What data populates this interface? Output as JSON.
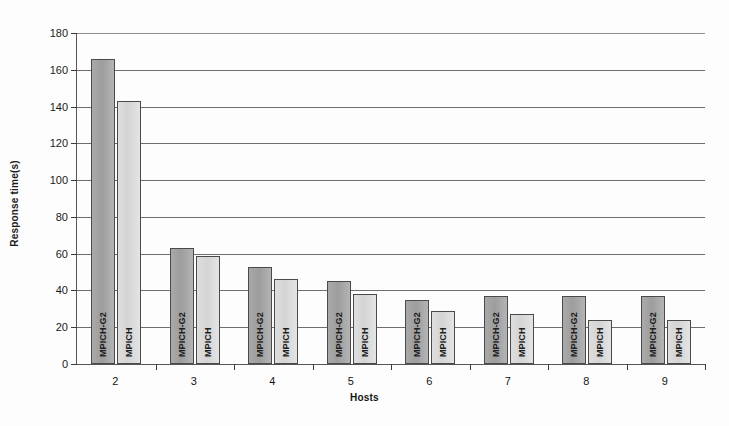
{
  "chart_data": {
    "type": "bar",
    "title": "",
    "xlabel": "Hosts",
    "ylabel": "Response time(s)",
    "categories": [
      "2",
      "3",
      "4",
      "5",
      "6",
      "7",
      "8",
      "9"
    ],
    "ylim": [
      0,
      180
    ],
    "yticks": [
      0,
      20,
      40,
      60,
      80,
      100,
      120,
      140,
      160,
      180
    ],
    "ytick_labels": [
      "0",
      "20",
      "40",
      "60",
      "80",
      "100",
      "120",
      "140",
      "160",
      "180"
    ],
    "grid": true,
    "legend": "none (bars labelled in-place)",
    "series": [
      {
        "name": "MPICH-G2",
        "color": "#a9a9a9",
        "values": [
          166,
          63,
          53,
          45,
          35,
          37,
          37,
          37
        ]
      },
      {
        "name": "MPICH",
        "color": "#dedede",
        "values": [
          143,
          59,
          46,
          38,
          29,
          27,
          24,
          24
        ]
      }
    ],
    "bar_captions": [
      [
        "MPICH-G2",
        "MPICH"
      ],
      [
        "MPICH-G2",
        "MPICH"
      ],
      [
        "MPICH-G2",
        "MPICH"
      ],
      [
        "MPICH-G2",
        "MPICH"
      ],
      [
        "MPICH-G2",
        "MPICH"
      ],
      [
        "MPICH-G2",
        "MPICH"
      ],
      [
        "MPICH-G2",
        "MPICH"
      ],
      [
        "MPICH-G2",
        "MPICH"
      ]
    ]
  }
}
